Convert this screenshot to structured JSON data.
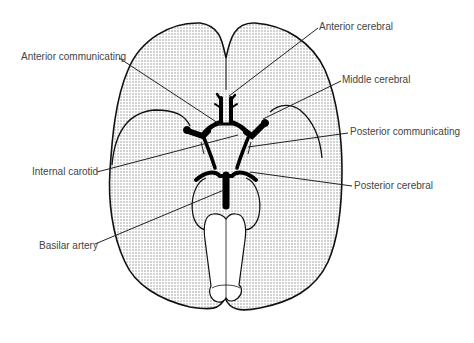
{
  "diagram": {
    "colors": {
      "outline": "#111111",
      "fill_stipple": "#d9d9d9",
      "artery": "#000000",
      "label_text": "#444444",
      "background": "#ffffff"
    },
    "labels": [
      {
        "id": "anterior-cerebral",
        "text": "Anterior cerebral",
        "x": 319,
        "y": 21
      },
      {
        "id": "anterior-communicating",
        "text": "Anterior communicating",
        "x": 21,
        "y": 51
      },
      {
        "id": "middle-cerebral",
        "text": "Middle cerebral",
        "x": 342,
        "y": 74
      },
      {
        "id": "posterior-communicating",
        "text": "Posterior communicating",
        "x": 350,
        "y": 126
      },
      {
        "id": "internal-carotid",
        "text": "Internal carotid",
        "x": 32,
        "y": 166
      },
      {
        "id": "posterior-cerebral",
        "text": "Posterior cerebral",
        "x": 354,
        "y": 180
      },
      {
        "id": "basilar-artery",
        "text": "Basilar artery",
        "x": 39,
        "y": 240
      }
    ]
  }
}
